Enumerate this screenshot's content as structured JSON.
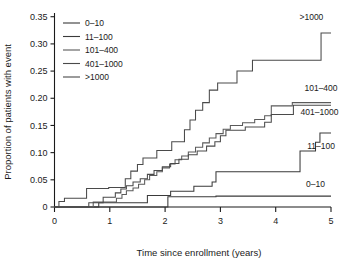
{
  "chart_data": {
    "type": "line",
    "title": "",
    "xlabel": "Time since enrollment (years)",
    "ylabel": "Proportion of patients with event",
    "xlim": [
      0,
      5
    ],
    "ylim": [
      0,
      0.355
    ],
    "grid": false,
    "legend_position": "top-left",
    "xticks": [
      0,
      1,
      2,
      3,
      4,
      5
    ],
    "xticklabels": [
      "0",
      "1",
      "2",
      "3",
      "4",
      "5"
    ],
    "yticks": [
      0,
      0.05,
      0.1,
      0.15,
      0.2,
      0.25,
      0.3,
      0.35
    ],
    "yticklabels": [
      "0",
      "0.05",
      "0.10",
      "0.15",
      "0.20",
      "0.25",
      "0.30",
      "0.35"
    ],
    "step_style": "post",
    "series": [
      {
        "name": "0–10",
        "color": "#3a3a3a",
        "end_label": "0–10",
        "end_label_x": 4.55,
        "end_label_y": 0.036,
        "x": [
          0.0,
          0.06,
          2.02,
          2.05,
          2.92,
          5.0
        ],
        "y": [
          0.0,
          0.0,
          0.0,
          0.019,
          0.02,
          0.02
        ]
      },
      {
        "name": "11–100",
        "color": "#3a3a3a",
        "end_label": "11–100",
        "end_label_x": 4.57,
        "end_label_y": 0.106,
        "x": [
          0.0,
          0.72,
          0.8,
          1.58,
          1.68,
          1.95,
          2.1,
          2.35,
          2.52,
          2.72,
          2.85,
          2.92,
          4.38,
          4.44,
          4.62,
          4.72,
          4.8,
          5.0
        ],
        "y": [
          0.0,
          0.0,
          0.008,
          0.008,
          0.021,
          0.021,
          0.029,
          0.029,
          0.038,
          0.038,
          0.046,
          0.065,
          0.065,
          0.103,
          0.103,
          0.119,
          0.136,
          0.136
        ]
      },
      {
        "name": "101–400",
        "color": "#5a5a5a",
        "end_label": "101–400",
        "end_label_x": 4.52,
        "end_label_y": 0.213,
        "x": [
          0.0,
          0.6,
          0.7,
          1.05,
          1.12,
          1.22,
          1.3,
          1.42,
          1.52,
          1.63,
          1.72,
          1.85,
          1.95,
          2.08,
          2.18,
          2.3,
          2.42,
          2.55,
          2.68,
          2.8,
          2.92,
          3.05,
          3.18,
          3.4,
          3.62,
          3.8,
          3.92,
          4.18,
          4.3,
          5.0
        ],
        "y": [
          0.0,
          0.0,
          0.009,
          0.009,
          0.016,
          0.023,
          0.03,
          0.035,
          0.042,
          0.05,
          0.058,
          0.065,
          0.072,
          0.079,
          0.087,
          0.094,
          0.101,
          0.11,
          0.118,
          0.127,
          0.135,
          0.143,
          0.15,
          0.155,
          0.161,
          0.168,
          0.186,
          0.186,
          0.192,
          0.192
        ]
      },
      {
        "name": "401–1000",
        "color": "#4a4a4a",
        "end_label": "401–1000",
        "end_label_x": 4.45,
        "end_label_y": 0.17,
        "x": [
          0.0,
          0.52,
          0.62,
          0.78,
          0.88,
          1.0,
          1.1,
          1.2,
          1.3,
          1.42,
          1.55,
          1.68,
          1.8,
          1.95,
          2.1,
          2.25,
          2.42,
          2.58,
          2.75,
          2.9,
          3.0,
          3.1,
          3.22,
          3.45,
          3.68,
          3.8,
          3.92,
          4.2,
          4.32,
          5.0
        ],
        "y": [
          0.0,
          0.0,
          0.008,
          0.008,
          0.018,
          0.018,
          0.026,
          0.033,
          0.039,
          0.046,
          0.052,
          0.06,
          0.067,
          0.074,
          0.08,
          0.088,
          0.096,
          0.103,
          0.112,
          0.12,
          0.131,
          0.141,
          0.141,
          0.147,
          0.147,
          0.156,
          0.17,
          0.17,
          0.187,
          0.187
        ]
      },
      {
        "name": ">1000",
        "color": "#4a4a4a",
        "end_label": ">1000",
        "end_label_x": 4.43,
        "end_label_y": 0.344,
        "x": [
          0.0,
          0.08,
          0.18,
          0.5,
          0.58,
          0.88,
          0.98,
          1.18,
          1.28,
          1.38,
          1.5,
          1.6,
          1.72,
          1.85,
          1.98,
          2.12,
          2.25,
          2.35,
          2.45,
          2.55,
          2.68,
          2.8,
          2.95,
          3.12,
          3.3,
          3.45,
          3.58,
          4.7,
          4.82,
          5.0
        ],
        "y": [
          0.0,
          0.01,
          0.016,
          0.016,
          0.034,
          0.034,
          0.036,
          0.036,
          0.052,
          0.066,
          0.078,
          0.09,
          0.09,
          0.104,
          0.104,
          0.12,
          0.12,
          0.142,
          0.16,
          0.178,
          0.192,
          0.215,
          0.228,
          0.228,
          0.25,
          0.25,
          0.27,
          0.27,
          0.32,
          0.32
        ]
      }
    ]
  },
  "legend": {
    "items": [
      {
        "label": "0–10",
        "color": "#3a3a3a"
      },
      {
        "label": "11–100",
        "color": "#3a3a3a"
      },
      {
        "label": "101–400",
        "color": "#5a5a5a"
      },
      {
        "label": "401–1000",
        "color": "#4a4a4a"
      },
      {
        "label": ">1000",
        "color": "#4a4a4a"
      }
    ]
  },
  "axes": {
    "x_title": "Time since enrollment (years)",
    "y_title": "Proportion of patients with event"
  },
  "colors": {
    "axis": "#1a1a1a",
    "background": "#ffffff",
    "text": "#1a1a1a"
  }
}
